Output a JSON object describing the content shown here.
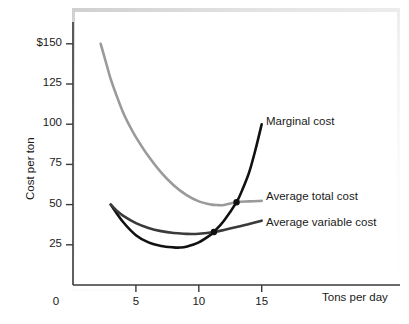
{
  "chart_data": {
    "type": "line",
    "title": "",
    "xlabel": "Tons per day",
    "ylabel": "Cost per ton",
    "xlim": [
      0,
      18.5
    ],
    "ylim": [
      0,
      168
    ],
    "grid": false,
    "legend_position": "right-inline-labels",
    "x_ticks": [
      {
        "value": 0,
        "label": "0"
      },
      {
        "value": 5,
        "label": "5"
      },
      {
        "value": 10,
        "label": "10"
      },
      {
        "value": 15,
        "label": "15"
      }
    ],
    "y_ticks": [
      {
        "value": 25,
        "label": "25"
      },
      {
        "value": 50,
        "label": "50"
      },
      {
        "value": 75,
        "label": "75"
      },
      {
        "value": 100,
        "label": "100"
      },
      {
        "value": 125,
        "label": "125"
      },
      {
        "value": 150,
        "label": "$150"
      }
    ],
    "series": [
      {
        "name": "Marginal cost",
        "color": "#111111",
        "width": 2.6,
        "points": [
          {
            "x": 3.0,
            "y": 50
          },
          {
            "x": 4.0,
            "y": 39
          },
          {
            "x": 5.0,
            "y": 31
          },
          {
            "x": 6.0,
            "y": 26.5
          },
          {
            "x": 7.0,
            "y": 24.3
          },
          {
            "x": 8.0,
            "y": 23.4
          },
          {
            "x": 8.5,
            "y": 23.3
          },
          {
            "x": 9.0,
            "y": 23.8
          },
          {
            "x": 10.0,
            "y": 26.5
          },
          {
            "x": 11.0,
            "y": 31.5
          },
          {
            "x": 11.2,
            "y": 33.0
          },
          {
            "x": 12.0,
            "y": 40.0
          },
          {
            "x": 13.0,
            "y": 51.5
          },
          {
            "x": 13.5,
            "y": 60.0
          },
          {
            "x": 14.0,
            "y": 70.0
          },
          {
            "x": 14.5,
            "y": 84.0
          },
          {
            "x": 15.0,
            "y": 100.0
          }
        ]
      },
      {
        "name": "Average total cost",
        "color": "#9a9a9a",
        "width": 2.6,
        "points": [
          {
            "x": 2.2,
            "y": 150
          },
          {
            "x": 2.6,
            "y": 139
          },
          {
            "x": 3.0,
            "y": 128
          },
          {
            "x": 3.5,
            "y": 117
          },
          {
            "x": 4.0,
            "y": 107
          },
          {
            "x": 4.5,
            "y": 99
          },
          {
            "x": 5.0,
            "y": 92
          },
          {
            "x": 6.0,
            "y": 80
          },
          {
            "x": 7.0,
            "y": 70
          },
          {
            "x": 8.0,
            "y": 62
          },
          {
            "x": 9.0,
            "y": 56
          },
          {
            "x": 10.0,
            "y": 52
          },
          {
            "x": 11.0,
            "y": 50
          },
          {
            "x": 11.5,
            "y": 49.7
          },
          {
            "x": 12.0,
            "y": 49.8
          },
          {
            "x": 13.0,
            "y": 51.5
          },
          {
            "x": 14.0,
            "y": 52.0
          },
          {
            "x": 15.0,
            "y": 52.3
          }
        ]
      },
      {
        "name": "Average variable cost",
        "color": "#3a3a3a",
        "width": 2.6,
        "points": [
          {
            "x": 3.0,
            "y": 50
          },
          {
            "x": 3.5,
            "y": 46
          },
          {
            "x": 4.0,
            "y": 43
          },
          {
            "x": 5.0,
            "y": 38.5
          },
          {
            "x": 6.0,
            "y": 35.5
          },
          {
            "x": 7.0,
            "y": 33.5
          },
          {
            "x": 8.0,
            "y": 32.3
          },
          {
            "x": 9.0,
            "y": 31.8
          },
          {
            "x": 9.5,
            "y": 31.7
          },
          {
            "x": 10.0,
            "y": 31.9
          },
          {
            "x": 11.2,
            "y": 33.0
          },
          {
            "x": 12.0,
            "y": 34.2
          },
          {
            "x": 13.0,
            "y": 36.0
          },
          {
            "x": 14.0,
            "y": 38.0
          },
          {
            "x": 15.0,
            "y": 40.0
          }
        ]
      }
    ],
    "intersections": [
      {
        "name": "mc-crosses-atc",
        "x": 13.0,
        "y": 51.5
      },
      {
        "name": "mc-crosses-avc",
        "x": 11.2,
        "y": 33.0
      }
    ],
    "annotations": [
      {
        "name": "marginal-cost-label",
        "text": "Marginal cost"
      },
      {
        "name": "average-total-cost-label",
        "text": "Average total cost"
      },
      {
        "name": "average-variable-cost-label",
        "text": "Average variable cost"
      }
    ]
  }
}
